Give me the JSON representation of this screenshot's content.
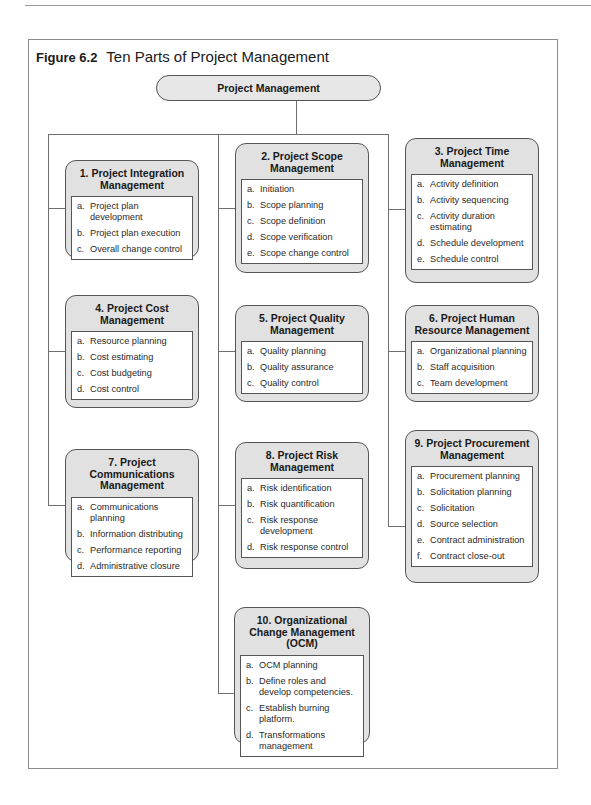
{
  "figure": {
    "number": "Figure 6.2",
    "title": "Ten Parts of Project Management",
    "root": "Project Management"
  },
  "boxes": [
    {
      "title": "1. Project Integration Management",
      "items": [
        {
          "letter": "a.",
          "text": "Project plan development"
        },
        {
          "letter": "b.",
          "text": "Project plan execution"
        },
        {
          "letter": "c.",
          "text": "Overall change control"
        }
      ]
    },
    {
      "title": "2. Project Scope Management",
      "items": [
        {
          "letter": "a.",
          "text": "Initiation"
        },
        {
          "letter": "b.",
          "text": "Scope planning"
        },
        {
          "letter": "c.",
          "text": "Scope definition"
        },
        {
          "letter": "d.",
          "text": "Scope verification"
        },
        {
          "letter": "e.",
          "text": "Scope change control"
        }
      ]
    },
    {
      "title": "3. Project Time Management",
      "items": [
        {
          "letter": "a.",
          "text": "Activity definition"
        },
        {
          "letter": "b.",
          "text": "Activity sequencing"
        },
        {
          "letter": "c.",
          "text": "Activity duration estimating"
        },
        {
          "letter": "d.",
          "text": "Schedule development"
        },
        {
          "letter": "e.",
          "text": "Schedule control"
        }
      ]
    },
    {
      "title": "4. Project Cost Management",
      "items": [
        {
          "letter": "a.",
          "text": "Resource planning"
        },
        {
          "letter": "b.",
          "text": "Cost estimating"
        },
        {
          "letter": "c.",
          "text": "Cost budgeting"
        },
        {
          "letter": "d.",
          "text": "Cost control"
        }
      ]
    },
    {
      "title": "5. Project Quality Management",
      "items": [
        {
          "letter": "a.",
          "text": "Quality planning"
        },
        {
          "letter": "b.",
          "text": "Quality assurance"
        },
        {
          "letter": "c.",
          "text": "Quality control"
        }
      ]
    },
    {
      "title": "6. Project Human Resource Management",
      "items": [
        {
          "letter": "a.",
          "text": "Organizational planning"
        },
        {
          "letter": "b.",
          "text": "Staff acquisition"
        },
        {
          "letter": "c.",
          "text": "Team development"
        }
      ]
    },
    {
      "title": "7. Project Communications Management",
      "items": [
        {
          "letter": "a.",
          "text": "Communications planning"
        },
        {
          "letter": "b.",
          "text": "Information distributing"
        },
        {
          "letter": "c.",
          "text": "Performance reporting"
        },
        {
          "letter": "d.",
          "text": "Administrative closure"
        }
      ]
    },
    {
      "title": "8. Project Risk Management",
      "items": [
        {
          "letter": "a.",
          "text": "Risk identification"
        },
        {
          "letter": "b.",
          "text": "Risk quantification"
        },
        {
          "letter": "c.",
          "text": "Risk response development"
        },
        {
          "letter": "d.",
          "text": "Risk response control"
        }
      ]
    },
    {
      "title": "9. Project Procurement Management",
      "items": [
        {
          "letter": "a.",
          "text": "Procurement planning"
        },
        {
          "letter": "b.",
          "text": "Solicitation planning"
        },
        {
          "letter": "c.",
          "text": "Solicitation"
        },
        {
          "letter": "d.",
          "text": "Source selection"
        },
        {
          "letter": "e.",
          "text": "Contract administration"
        },
        {
          "letter": "f.",
          "text": "Contract close-out"
        }
      ]
    },
    {
      "title": "10. Organizational Change Management (OCM)",
      "items": [
        {
          "letter": "a.",
          "text": "OCM planning"
        },
        {
          "letter": "b.",
          "text": "Define roles and develop competencies."
        },
        {
          "letter": "c.",
          "text": "Establish burning platform."
        },
        {
          "letter": "d.",
          "text": "Transformations management"
        }
      ]
    }
  ],
  "colors": {
    "box_fill": "#e1e1e1",
    "box_border": "#555555",
    "connector": "#6f6f6f",
    "frame": "#8c8c8c"
  }
}
